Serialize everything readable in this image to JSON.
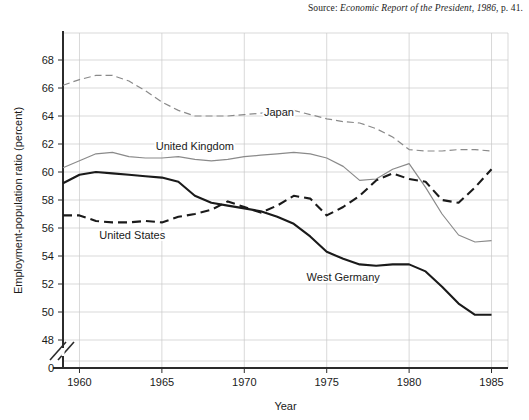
{
  "source": {
    "label": "Source: ",
    "title": "Economic Report of the President, 1986",
    "page": ", p. 41."
  },
  "chart_data": {
    "type": "line",
    "title": "",
    "xlabel": "Year",
    "ylabel": "Employment-population ratio (percent)",
    "xlim": [
      1959,
      1986
    ],
    "ylim": [
      47,
      69
    ],
    "xticks": [
      1960,
      1965,
      1970,
      1975,
      1980,
      1985
    ],
    "xtick_labels": [
      "1960",
      "1965",
      "1970",
      "1975",
      "1980",
      "1985"
    ],
    "yticks": [
      48,
      50,
      52,
      54,
      56,
      58,
      60,
      62,
      64,
      66,
      68
    ],
    "ytick_labels": [
      "48",
      "50",
      "52",
      "54",
      "56",
      "58",
      "60",
      "62",
      "64",
      "66",
      "68"
    ],
    "y_origin_label": "0",
    "axis_break": true,
    "grid": true,
    "legend": "inline-annotations",
    "x": [
      1959,
      1960,
      1961,
      1962,
      1963,
      1964,
      1965,
      1966,
      1967,
      1968,
      1969,
      1970,
      1971,
      1972,
      1973,
      1974,
      1975,
      1976,
      1977,
      1978,
      1979,
      1980,
      1981,
      1982,
      1983,
      1984,
      1985
    ],
    "series": [
      {
        "name": "Japan",
        "color": "#8a8a8a",
        "style": "dashed",
        "label_x": 1972.1,
        "label_y": 64.0,
        "values": [
          66.2,
          66.6,
          66.9,
          66.9,
          66.5,
          65.8,
          65.0,
          64.4,
          64.0,
          64.0,
          64.0,
          64.1,
          64.2,
          64.2,
          64.4,
          64.1,
          63.8,
          63.6,
          63.5,
          63.1,
          62.5,
          61.6,
          61.5,
          61.5,
          61.6,
          61.6,
          61.5
        ]
      },
      {
        "name": "United Kingdom",
        "color": "#8a8a8a",
        "style": "solid",
        "label_x": 1967.0,
        "label_y": 61.6,
        "values": [
          60.3,
          60.8,
          61.3,
          61.4,
          61.1,
          61.0,
          61.0,
          61.1,
          60.9,
          60.8,
          60.9,
          61.1,
          61.2,
          61.3,
          61.4,
          61.3,
          61.0,
          60.4,
          59.4,
          59.5,
          60.2,
          60.6,
          58.9,
          57.0,
          55.5,
          55.0,
          55.1
        ]
      },
      {
        "name": "United States",
        "color": "#1a1a1a",
        "style": "dashed",
        "label_x": 1963.2,
        "label_y": 55.2,
        "values": [
          56.9,
          56.9,
          56.5,
          56.4,
          56.4,
          56.5,
          56.4,
          56.8,
          57.0,
          57.3,
          57.9,
          57.5,
          57.1,
          57.6,
          58.3,
          58.1,
          56.9,
          57.5,
          58.3,
          59.4,
          59.9,
          59.5,
          59.3,
          58.0,
          57.8,
          58.9,
          60.2
        ]
      },
      {
        "name": "West Germany",
        "color": "#1a1a1a",
        "style": "solid",
        "label_x": 1976.0,
        "label_y": 52.2,
        "values": [
          59.2,
          59.8,
          60.0,
          59.9,
          59.8,
          59.7,
          59.6,
          59.3,
          58.3,
          57.8,
          57.6,
          57.4,
          57.2,
          56.8,
          56.3,
          55.4,
          54.3,
          53.8,
          53.4,
          53.3,
          53.4,
          53.4,
          52.9,
          51.8,
          50.6,
          49.8,
          49.8
        ]
      }
    ]
  }
}
